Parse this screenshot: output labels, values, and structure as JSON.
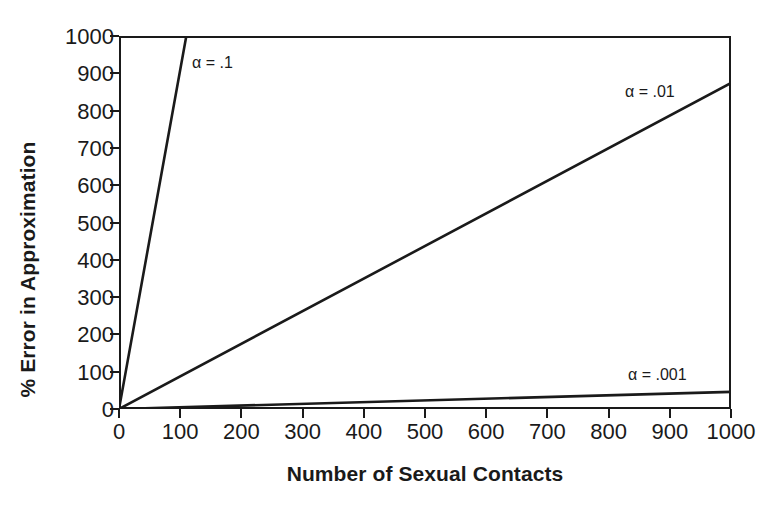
{
  "chart_data": {
    "type": "line",
    "title": "",
    "xlabel": "Number of Sexual Contacts",
    "ylabel": "% Error in Approximation",
    "xlim": [
      0,
      1000
    ],
    "ylim": [
      0,
      1000
    ],
    "xticks": [
      0,
      100,
      200,
      300,
      400,
      500,
      600,
      700,
      800,
      900,
      1000
    ],
    "yticks": [
      0,
      100,
      200,
      300,
      400,
      500,
      600,
      700,
      800,
      900,
      1000
    ],
    "xtick_labels": [
      "0",
      "100",
      "200",
      "300",
      "400",
      "500",
      "600",
      "700",
      "800",
      "900",
      "1000"
    ],
    "ytick_labels": [
      "0",
      "100",
      "200",
      "300",
      "400",
      "500",
      "600",
      "700",
      "800",
      "900",
      "1000"
    ],
    "grid": false,
    "legend": "inline annotations",
    "line_color": "#1a1a1a",
    "series": [
      {
        "name": "alpha = .1",
        "annotation": "α = .1",
        "annotation_x": 192,
        "annotation_y": 55,
        "x": [
          0,
          110
        ],
        "values": [
          0,
          1000
        ],
        "note": "steepest line; exits top of frame near x = 110"
      },
      {
        "name": "alpha = .01",
        "annotation": "α = .01",
        "annotation_x": 625,
        "annotation_y": 84,
        "x": [
          0,
          1000
        ],
        "values": [
          0,
          874
        ],
        "note": "reaches about 875% at 1000 contacts"
      },
      {
        "name": "alpha = .001",
        "annotation": "α = .001",
        "annotation_x": 628,
        "annotation_y": 367,
        "x": [
          0,
          1000
        ],
        "values": [
          0,
          46
        ],
        "note": "nearly flat; reaches about 46% at 1000 contacts"
      }
    ]
  }
}
